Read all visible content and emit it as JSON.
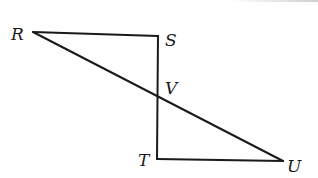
{
  "diagram": {
    "type": "geometry",
    "points": {
      "R": {
        "label": "R",
        "x": 33,
        "y": 32
      },
      "S": {
        "label": "S",
        "x": 158,
        "y": 36
      },
      "V": {
        "label": "V",
        "x": 158,
        "y": 97
      },
      "T": {
        "label": "T",
        "x": 157,
        "y": 159
      },
      "U": {
        "label": "U",
        "x": 283,
        "y": 161
      }
    },
    "segments": [
      [
        "R",
        "S"
      ],
      [
        "S",
        "T"
      ],
      [
        "R",
        "U"
      ],
      [
        "T",
        "U"
      ]
    ],
    "labels": {
      "R": "R",
      "S": "S",
      "V": "V",
      "T": "T",
      "U": "U"
    }
  }
}
